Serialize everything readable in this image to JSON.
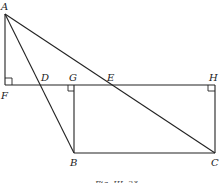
{
  "figure": {
    "caption": "Fig. III. 23",
    "points": {
      "A": {
        "label": "A",
        "x": 5,
        "y": 14
      },
      "F": {
        "label": "F",
        "x": 5,
        "y": 85
      },
      "D": {
        "label": "D",
        "x": 41,
        "y": 85
      },
      "G": {
        "label": "G",
        "x": 74,
        "y": 85
      },
      "E": {
        "label": "E",
        "x": 110,
        "y": 85
      },
      "H": {
        "label": "H",
        "x": 215,
        "y": 85
      },
      "B": {
        "label": "B",
        "x": 74,
        "y": 153
      },
      "C": {
        "label": "C",
        "x": 215,
        "y": 153
      }
    },
    "segments": [
      "AF",
      "FH",
      "AC",
      "AB",
      "GB",
      "HC",
      "BC"
    ],
    "right_angles": [
      "F",
      "G",
      "H"
    ]
  }
}
